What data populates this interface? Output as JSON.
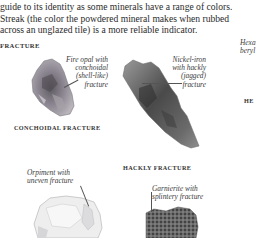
{
  "intro": {
    "lines": [
      "guide to its identity as some minerals have a range of colors.",
      "Streak (the color the powdered mineral makes when rubbed",
      "across an unglazed tile) is a more reliable indicator."
    ]
  },
  "section": {
    "title": "FRACTURE"
  },
  "specimens": [
    {
      "caption_lines": [
        "Fire opal with",
        "conchoidal",
        "(shell-like)",
        "fracture"
      ],
      "label": "CONCHOIDAL FRACTURE"
    },
    {
      "caption_lines": [
        "Nickel-iron",
        "with hackly",
        "(jagged)",
        "fracture"
      ],
      "label": "HACKLY FRACTURE"
    },
    {
      "caption_lines": [
        "Orpiment with",
        "uneven fracture"
      ]
    },
    {
      "caption_lines": [
        "Garnierite with",
        "splintery fracture"
      ]
    }
  ],
  "right_edge": {
    "caption_lines": [
      "Hexa",
      "beryl"
    ],
    "label_fragment": "HE"
  }
}
